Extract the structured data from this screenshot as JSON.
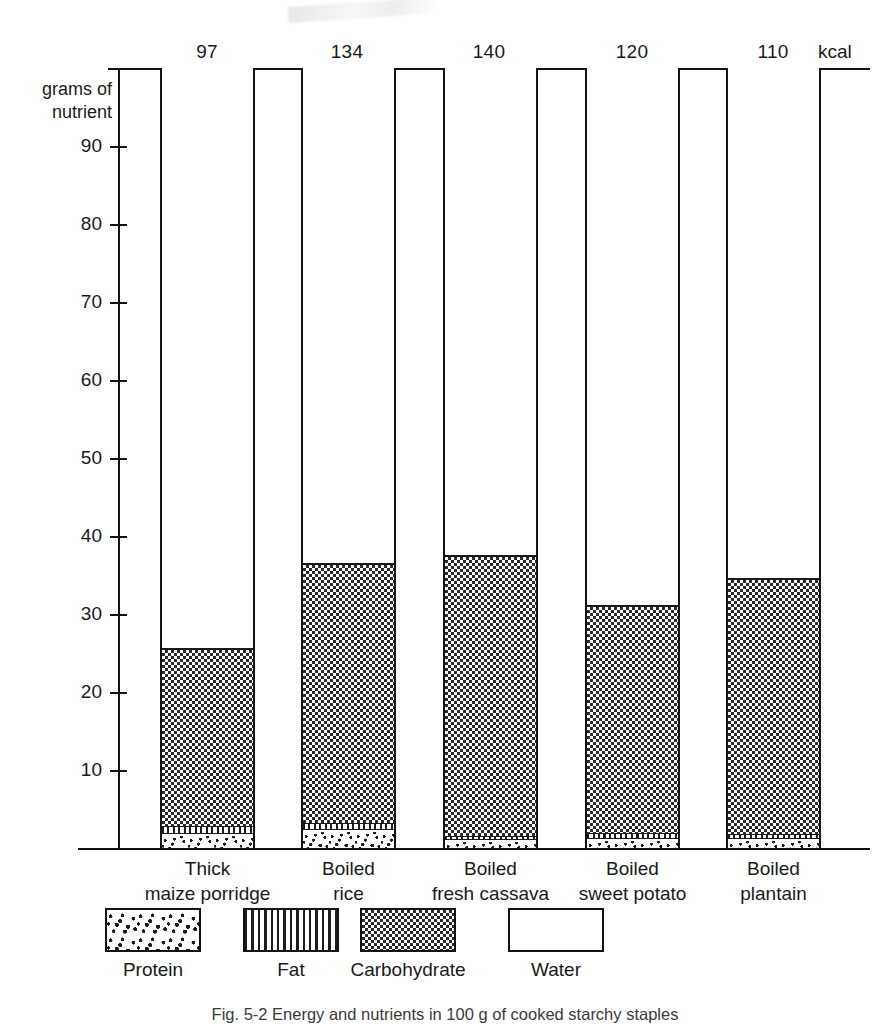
{
  "figure": {
    "caption": "Fig. 5-2 Energy and nutrients in 100 g of cooked starchy staples",
    "kcal_unit_label": "kcal",
    "y_axis_label_line1": "grams of",
    "y_axis_label_line2": "nutrient"
  },
  "chart_data": {
    "type": "bar",
    "title": "Energy and nutrients in 100 g of cooked starchy staples",
    "subtype": "stacked-bar",
    "xlabel": "",
    "ylabel": "grams of nutrient",
    "ylim": [
      0,
      100
    ],
    "yticks": [
      10,
      20,
      30,
      40,
      50,
      60,
      70,
      80,
      90
    ],
    "ytick_labels": [
      "10",
      "20",
      "30",
      "40",
      "50",
      "60",
      "70",
      "80",
      "90"
    ],
    "grid": false,
    "legend_position": "bottom",
    "secondary_axis": {
      "position": "top",
      "unit": "kcal",
      "values": [
        97,
        134,
        140,
        120,
        110
      ],
      "labels": [
        "97",
        "134",
        "140",
        "120",
        "110"
      ]
    },
    "categories": [
      "Thick maize porridge",
      "Boiled rice",
      "Boiled fresh cassava",
      "Boiled sweet potato",
      "Boiled plantain"
    ],
    "category_lines": [
      [
        "Thick",
        "maize  porridge"
      ],
      [
        "Boiled",
        "rice"
      ],
      [
        "Boiled",
        "fresh cassava"
      ],
      [
        "Boiled",
        "sweet potato"
      ],
      [
        "Boiled",
        "plantain"
      ]
    ],
    "series": [
      {
        "name": "Protein",
        "pattern": "dots",
        "values": [
          1.8,
          2.3,
          1.0,
          1.2,
          1.1
        ]
      },
      {
        "name": "Fat",
        "pattern": "vertical-lines",
        "values": [
          1.0,
          0.9,
          0.6,
          0.7,
          0.7
        ]
      },
      {
        "name": "Carbohydrate",
        "pattern": "checkerboard",
        "values": [
          22.8,
          33.3,
          36.0,
          29.3,
          32.8
        ]
      },
      {
        "name": "Water",
        "pattern": "blank",
        "values": [
          74.4,
          63.5,
          62.4,
          68.8,
          65.4
        ]
      }
    ],
    "legend_entries": [
      "Protein",
      "Fat",
      "Carbohydrate",
      "Water"
    ],
    "annotations": [
      "kcal values shown along top axis"
    ]
  }
}
